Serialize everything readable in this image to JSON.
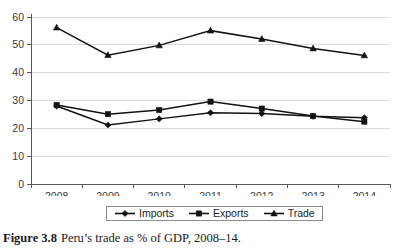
{
  "figure": {
    "caption_label": "Figure 3.8",
    "caption_text": "Peru’s trade as % of GDP, 2008–14."
  },
  "legend": {
    "position": "bottom-center",
    "entries": [
      {
        "label": "Imports",
        "marker": "diamond-marker"
      },
      {
        "label": "Exports",
        "marker": "square-marker"
      },
      {
        "label": "Trade",
        "marker": "triangle-marker"
      }
    ]
  },
  "colors": {
    "series": "#121212",
    "grid": "#d9d9d9",
    "axis": "#58585a",
    "tick_text": "#3b3b3b",
    "background": "#ffffff"
  },
  "chart_data": {
    "type": "line",
    "title": "",
    "xlabel": "",
    "ylabel": "",
    "x": [
      "2008",
      "2009",
      "2010",
      "2011",
      "2012",
      "2013",
      "2014"
    ],
    "categories": [
      "2008",
      "2009",
      "2010",
      "2011",
      "2012",
      "2013",
      "2014"
    ],
    "series": [
      {
        "name": "Imports",
        "marker": "diamond",
        "values": [
          28.0,
          21.2,
          23.4,
          25.6,
          25.3,
          24.3,
          23.8
        ]
      },
      {
        "name": "Exports",
        "marker": "square",
        "values": [
          28.4,
          25.1,
          26.6,
          29.6,
          27.1,
          24.4,
          22.4
        ]
      },
      {
        "name": "Trade",
        "marker": "triangle",
        "values": [
          56.2,
          46.3,
          49.8,
          55.1,
          52.1,
          48.7,
          46.2
        ]
      }
    ],
    "ylim": [
      0,
      60
    ],
    "yticks": [
      0,
      10,
      20,
      30,
      40,
      50,
      60
    ],
    "ytick_labels": [
      "0",
      "10",
      "20",
      "30",
      "40",
      "50",
      "60"
    ],
    "xtick_labels": [
      "2008",
      "2009",
      "2010",
      "2011",
      "2012",
      "2013",
      "2014"
    ],
    "grid": "horizontal",
    "legend_position": "bottom"
  }
}
